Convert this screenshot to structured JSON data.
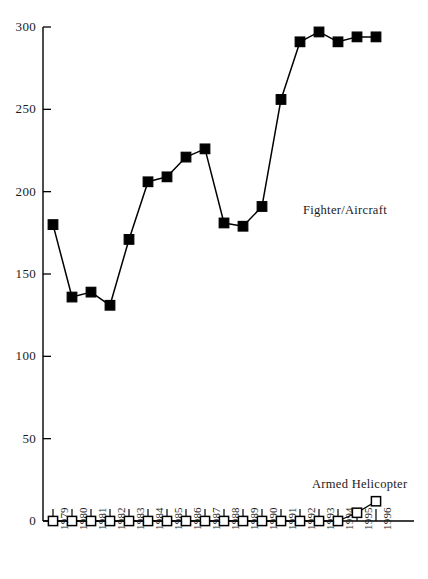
{
  "chart_data": {
    "type": "line",
    "title": "",
    "subtitle": "",
    "xlabel": "",
    "ylabel": "",
    "categories": [
      "1979",
      "1980",
      "1981",
      "1982",
      "1983",
      "1984",
      "1985",
      "1986",
      "1987",
      "1988",
      "1989",
      "1990",
      "1991",
      "1992",
      "1993",
      "1994",
      "1995",
      "1996"
    ],
    "series": [
      {
        "name": "Fighter/Aircraft",
        "marker": "filled-square",
        "values": [
          180,
          136,
          139,
          131,
          171,
          206,
          209,
          221,
          226,
          181,
          179,
          191,
          256,
          291,
          297,
          291,
          294,
          294
        ]
      },
      {
        "name": "Armed Helicopter",
        "marker": "open-square",
        "values": [
          0,
          0,
          0,
          0,
          0,
          0,
          0,
          0,
          0,
          0,
          0,
          0,
          0,
          0,
          0,
          0,
          5,
          12
        ]
      }
    ],
    "ylim": [
      0,
      300
    ],
    "xlim": [
      "1979",
      "1996"
    ],
    "yticks": [
      0,
      50,
      100,
      150,
      200,
      250,
      300
    ],
    "ytick_labels": [
      "0",
      "50",
      "100",
      "150",
      "200",
      "250",
      "300"
    ],
    "grid": false,
    "legend_position": "inline-annotation",
    "annotations": [
      {
        "text": "Fighter/Aircraft",
        "x": 303,
        "y": 203
      },
      {
        "text": "Armed Helicopter",
        "x": 312,
        "y": 477
      }
    ],
    "colors": {
      "line": "#000000",
      "marker_fill": "#000000",
      "marker_open_fill": "#ffffff",
      "axis": "#000000",
      "background": "#ffffff"
    }
  },
  "axis": {
    "y_labels": [
      "300",
      "250",
      "200",
      "150",
      "100",
      "50",
      "0"
    ],
    "x_labels": [
      "1979",
      "1980",
      "1981",
      "1982",
      "1983",
      "1984",
      "1985",
      "1986",
      "1987",
      "1988",
      "1989",
      "1990",
      "1991",
      "1992",
      "1993",
      "1994",
      "1995",
      "1996"
    ]
  },
  "labels": {
    "fighter": "Fighter/Aircraft",
    "helicopter": "Armed Helicopter"
  }
}
